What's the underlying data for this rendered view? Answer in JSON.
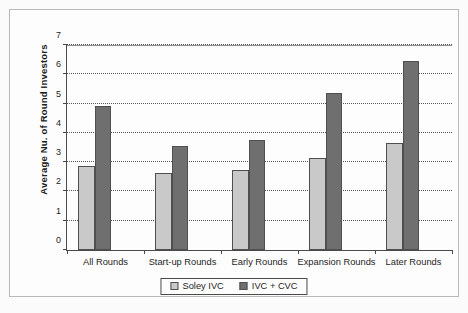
{
  "chart_data": {
    "type": "bar",
    "title": "",
    "subtitle": "",
    "xlabel": "",
    "ylabel": "Average Nu. of Round Investors",
    "categories": [
      "All Rounds",
      "Start-up Rounds",
      "Early Rounds",
      "Expansion Rounds",
      "Later Rounds"
    ],
    "series": [
      {
        "name": "Soley IVC",
        "color": "#c9c9c9",
        "values": [
          2.86,
          2.62,
          2.72,
          3.13,
          3.67
        ]
      },
      {
        "name": "IVC + CVC",
        "color": "#6f6f6f",
        "values": [
          4.93,
          3.54,
          3.74,
          5.37,
          6.46
        ]
      }
    ],
    "ylim": [
      0,
      7
    ],
    "ytick_labels": [
      "0",
      "1",
      "2",
      "3",
      "4",
      "5",
      "6",
      "7"
    ],
    "ytick_values": [
      0,
      1,
      2,
      3,
      4,
      5,
      6,
      7
    ],
    "grid": true,
    "grid_style": "dotted-horizontal",
    "legend_position": "bottom-center",
    "axis_color": "#4a4a4a",
    "bar_outline_color": "#4f4f4f",
    "background_color": "#fdfdfd"
  },
  "legend": {
    "entries": [
      {
        "label": "Soley IVC"
      },
      {
        "label": "IVC + CVC"
      }
    ]
  }
}
